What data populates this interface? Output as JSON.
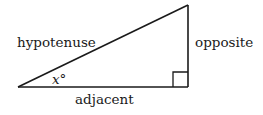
{
  "diagram": {
    "type": "right-triangle",
    "labels": {
      "hypotenuse": "hypotenuse",
      "opposite": "opposite",
      "adjacent": "adjacent",
      "angle": "x°"
    },
    "vertices": {
      "angle_vertex": [
        18,
        87
      ],
      "right_angle_vertex": [
        188,
        87
      ],
      "top_vertex": [
        188,
        5
      ]
    },
    "right_angle_marker_size": 15,
    "stroke_color": "#1a1a1a",
    "background": "#ffffff"
  }
}
